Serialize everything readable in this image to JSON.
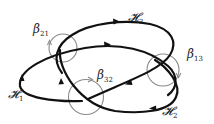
{
  "diagram": {
    "type": "link diagram with meridian loops",
    "curves": [
      {
        "id": "H1",
        "label": "𝓗",
        "subscript": "1"
      },
      {
        "id": "H2",
        "label": "𝓗",
        "subscript": "2"
      },
      {
        "id": "H3",
        "label": "𝓗",
        "subscript": "3"
      }
    ],
    "loops": [
      {
        "id": "beta21",
        "label": "β",
        "subscript": "21"
      },
      {
        "id": "beta13",
        "label": "β",
        "subscript": "13"
      },
      {
        "id": "beta32",
        "label": "β",
        "subscript": "32"
      }
    ],
    "colors": {
      "curve": "#111111",
      "loop": "#8a8a8a",
      "background": "#ffffff"
    }
  }
}
